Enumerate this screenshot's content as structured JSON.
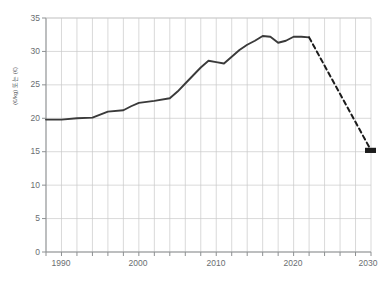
{
  "chart_data": {
    "type": "line",
    "title": "",
    "xlabel": "",
    "ylabel": "(€/kg) 또는 (€)",
    "xlim": [
      1988,
      2030
    ],
    "ylim": [
      0,
      35
    ],
    "grid": true,
    "legend": null,
    "x_ticks": [
      1990,
      2000,
      2010,
      2020,
      2030
    ],
    "y_ticks": [
      0,
      5,
      10,
      15,
      20,
      25,
      30,
      35
    ],
    "x_minor_step": 2,
    "series": [
      {
        "name": "historical",
        "style": "solid",
        "color": "#3a3a3a",
        "x": [
          1988,
          1990,
          1992,
          1994,
          1996,
          1998,
          1999,
          2000,
          2002,
          2004,
          2005,
          2006,
          2007,
          2008,
          2009,
          2010,
          2011,
          2012,
          2013,
          2014,
          2015,
          2016,
          2017,
          2018,
          2019,
          2020,
          2021,
          2022
        ],
        "values": [
          19.8,
          19.8,
          20.0,
          20.1,
          21.0,
          21.2,
          21.8,
          22.3,
          22.6,
          23.0,
          24.0,
          25.2,
          26.4,
          27.6,
          28.6,
          28.4,
          28.2,
          29.2,
          30.2,
          31.0,
          31.6,
          32.3,
          32.2,
          31.3,
          31.6,
          32.2,
          32.2,
          32.1
        ]
      },
      {
        "name": "projection",
        "style": "dashed",
        "color": "#1c1c1c",
        "x": [
          2022,
          2030
        ],
        "values": [
          32.1,
          15.2
        ],
        "endpoint_marker": true
      }
    ]
  },
  "axis": {
    "y_label_text": "(€/kg) 또는 (€)",
    "y_tick_labels": [
      "0",
      "5",
      "10",
      "15",
      "20",
      "25",
      "30",
      "35"
    ],
    "x_tick_labels": [
      "1990",
      "2000",
      "2010",
      "2020",
      "2030"
    ]
  },
  "colors": {
    "grid": "#c9c9c9",
    "axis": "#8d9092",
    "line": "#3a3a3a",
    "dash": "#1c1c1c",
    "tick_text": "#6a6e71",
    "background": "#ffffff"
  }
}
